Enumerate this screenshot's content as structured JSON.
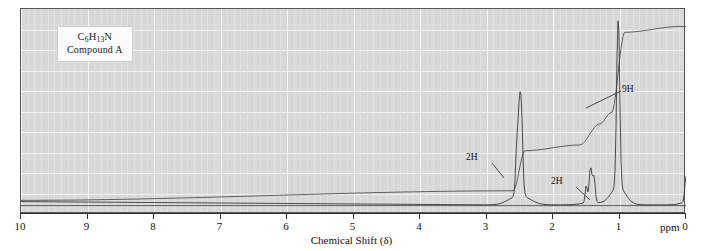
{
  "compound": {
    "formula_prefix": "C",
    "formula_c": "6",
    "formula_h_sym": "H",
    "formula_h": "13",
    "formula_n": "N",
    "name": "Compound A"
  },
  "axis": {
    "title": "Chemical Shift (δ)",
    "unit": "ppm",
    "ticks": [
      "10",
      "9",
      "8",
      "7",
      "6",
      "5",
      "4",
      "3",
      "2",
      "1",
      "0"
    ],
    "range_max": 10,
    "range_min": 0
  },
  "annotations": [
    {
      "label": "9H",
      "shift": 1.0
    },
    {
      "label": "2H",
      "shift": 2.5
    },
    {
      "label": "2H",
      "shift": 1.4
    }
  ],
  "colors": {
    "plot_background": "#d8d8d8",
    "gridline": "#f2f2f2",
    "trace": "#3a3a3a",
    "integration": "#4a4a4a",
    "frame": "#555555",
    "axis": "#333333"
  },
  "chart_data": {
    "type": "line",
    "title": "",
    "xlabel": "Chemical Shift (δ)",
    "ylabel": "",
    "xlim": [
      10,
      0
    ],
    "ylim": [
      0,
      100
    ],
    "grid": true,
    "legend": "none",
    "x_unit": "ppm",
    "series": [
      {
        "name": "1H NMR spectrum",
        "peaks": [
          {
            "shift": 2.5,
            "height": 52,
            "integration": 2,
            "label": "2H",
            "multiplicity": "triplet"
          },
          {
            "shift": 1.42,
            "height": 12,
            "integration": 2,
            "label": "2H",
            "multiplicity": "multiplet"
          },
          {
            "shift": 1.02,
            "height": 96,
            "integration": 9,
            "label": "9H",
            "multiplicity": "singlet"
          },
          {
            "shift": 0.0,
            "height": 14,
            "integration": 0,
            "label": "TMS",
            "multiplicity": "singlet"
          }
        ],
        "baseline": 0
      },
      {
        "name": "integration trace",
        "steps": [
          {
            "shift": 10.0,
            "level": 4
          },
          {
            "shift": 2.6,
            "level": 9
          },
          {
            "shift": 2.42,
            "level": 30
          },
          {
            "shift": 1.6,
            "level": 33
          },
          {
            "shift": 1.3,
            "level": 44
          },
          {
            "shift": 1.12,
            "level": 50
          },
          {
            "shift": 0.92,
            "level": 92
          },
          {
            "shift": 0.1,
            "level": 95
          }
        ]
      }
    ]
  }
}
